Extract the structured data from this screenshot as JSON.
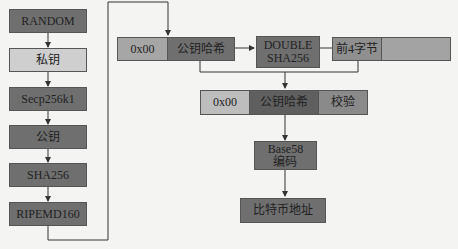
{
  "left_column": [
    {
      "label": "RANDOM"
    },
    {
      "label": "私钥"
    },
    {
      "label": "Secp256k1"
    },
    {
      "label": "公钥"
    },
    {
      "label": "SHA256"
    },
    {
      "label": "RIPEMD160"
    }
  ],
  "top_row": {
    "version": "0x00",
    "pubkey_hash": "公钥哈希",
    "double_sha": "DOUBLE\nSHA256",
    "first4": "前4字节"
  },
  "mid_row": {
    "version": "0x00",
    "pubkey_hash": "公钥哈希",
    "checksum": "校验"
  },
  "base58": "Base58\n编码",
  "address": "比特币地址"
}
